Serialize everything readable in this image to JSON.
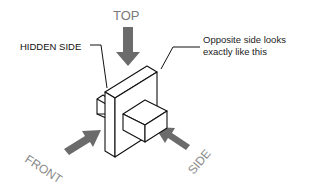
{
  "diagram": {
    "labels": {
      "top": "TOP",
      "hidden_side": "HIDDEN SIDE",
      "opposite_side_line1": "Opposite side looks",
      "opposite_side_line2": "exactly like this",
      "front": "FRONT",
      "side": "SIDE"
    },
    "colors": {
      "arrow": "#6b6b6b",
      "outline": "#111111",
      "label_gray": "#8a8a8a",
      "background": "#ffffff"
    }
  }
}
